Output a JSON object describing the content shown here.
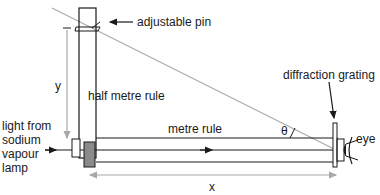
{
  "labels": {
    "adjustable_pin": "adjustable pin",
    "half_metre_rule": "half metre rule",
    "diffraction_grating": "diffraction grating",
    "metre_rule": "metre rule",
    "eye": "eye",
    "theta": "θ",
    "y": "y",
    "x": "x",
    "light_line1": "light from",
    "light_line2": "sodium",
    "light_line3": "vapour",
    "light_line4": "lamp"
  },
  "colors": {
    "line": "#1a1a1a",
    "grey_line": "#a8a8a8",
    "block_fill": "#8a8a8a"
  }
}
